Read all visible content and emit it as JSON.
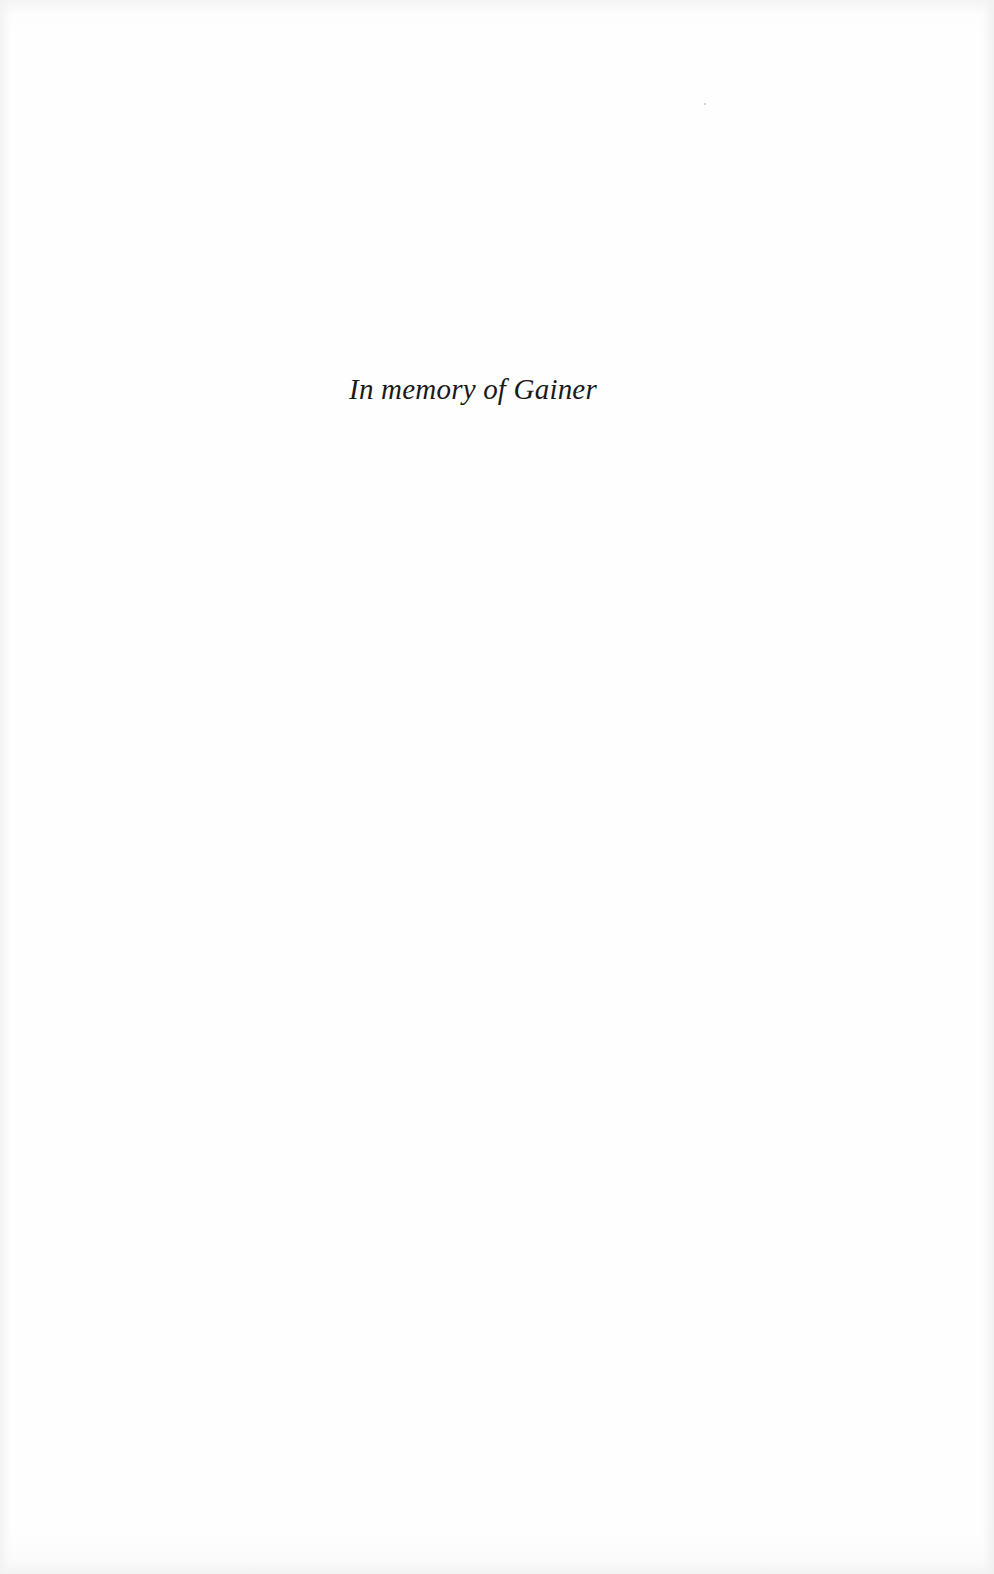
{
  "page": {
    "type": "dedication",
    "text": "In memory of Gainer",
    "colors": {
      "background": "#fefefe",
      "text": "#1a1a1a"
    }
  }
}
